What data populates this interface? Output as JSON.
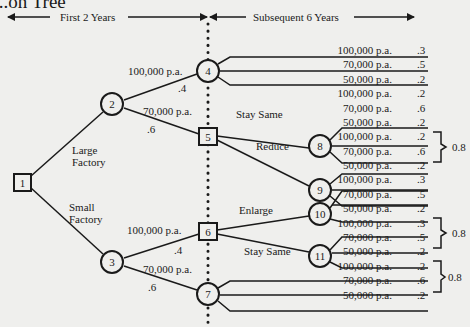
{
  "title": "...on Tree",
  "header": {
    "left_label": "First 2 Years",
    "right_label": "Subsequent 6 Years"
  },
  "nodes": {
    "n1": "1",
    "n2": "2",
    "n3": "3",
    "n4": "4",
    "n5": "5",
    "n6": "6",
    "n7": "7",
    "n8": "8",
    "n9": "9",
    "n10": "10",
    "n11": "11"
  },
  "branches": {
    "large_factory_line1": "Large",
    "large_factory_line2": "Factory",
    "small_factory_line1": "Small",
    "small_factory_line2": "Factory",
    "n2_high": "100,000 p.a.",
    "n2_high_prob": ".4",
    "n2_med": "70,000 p.a.",
    "n2_med_prob": ".6",
    "n3_high": "100,000 p.a.",
    "n3_high_prob": ".4",
    "n3_med": "70,000 p.a.",
    "n3_med_prob": ".6",
    "n5_stay": "Stay Same",
    "n5_reduce": "Reduce",
    "n6_enlarge": "Enlarge",
    "n6_stay": "Stay Same"
  },
  "outcomes": [
    {
      "node": "4",
      "value": "100,000 p.a.",
      "prob": ".3"
    },
    {
      "node": "4",
      "value": "70,000 p.a.",
      "prob": ".5"
    },
    {
      "node": "4",
      "value": "50,000 p.a.",
      "prob": ".2"
    },
    {
      "node": "8",
      "value": "100,000 p.a.",
      "prob": ".2"
    },
    {
      "node": "8",
      "value": "70,000 p.a.",
      "prob": ".6"
    },
    {
      "node": "8",
      "value": "50,000 p.a.",
      "prob": ".2"
    },
    {
      "node": "9",
      "value": "100,000 p.a.",
      "prob": ".2"
    },
    {
      "node": "9",
      "value": "70,000 p.a.",
      "prob": ".6"
    },
    {
      "node": "9",
      "value": "50,000 p.a.",
      "prob": ".2"
    },
    {
      "node": "10",
      "value": "100,000 p.a.",
      "prob": ".3"
    },
    {
      "node": "10",
      "value": "70,000 p.a.",
      "prob": ".5"
    },
    {
      "node": "10",
      "value": "50,000 p.a.",
      "prob": ".2"
    },
    {
      "node": "11",
      "value": "100,000 p.a.",
      "prob": ".3"
    },
    {
      "node": "11",
      "value": "70,000 p.a.",
      "prob": ".5"
    },
    {
      "node": "11",
      "value": "50,000 p.a.",
      "prob": ".2"
    },
    {
      "node": "7",
      "value": "100,000 p.a.",
      "prob": ".2"
    },
    {
      "node": "7",
      "value": "70,000 p.a.",
      "prob": ".6"
    },
    {
      "node": "7",
      "value": "50,000 p.a.",
      "prob": ".2"
    }
  ],
  "brackets": [
    {
      "group": "node-9",
      "label": "0.8"
    },
    {
      "group": "node-11",
      "label": "0.8"
    },
    {
      "group": "node-7",
      "label": "0.8"
    }
  ]
}
